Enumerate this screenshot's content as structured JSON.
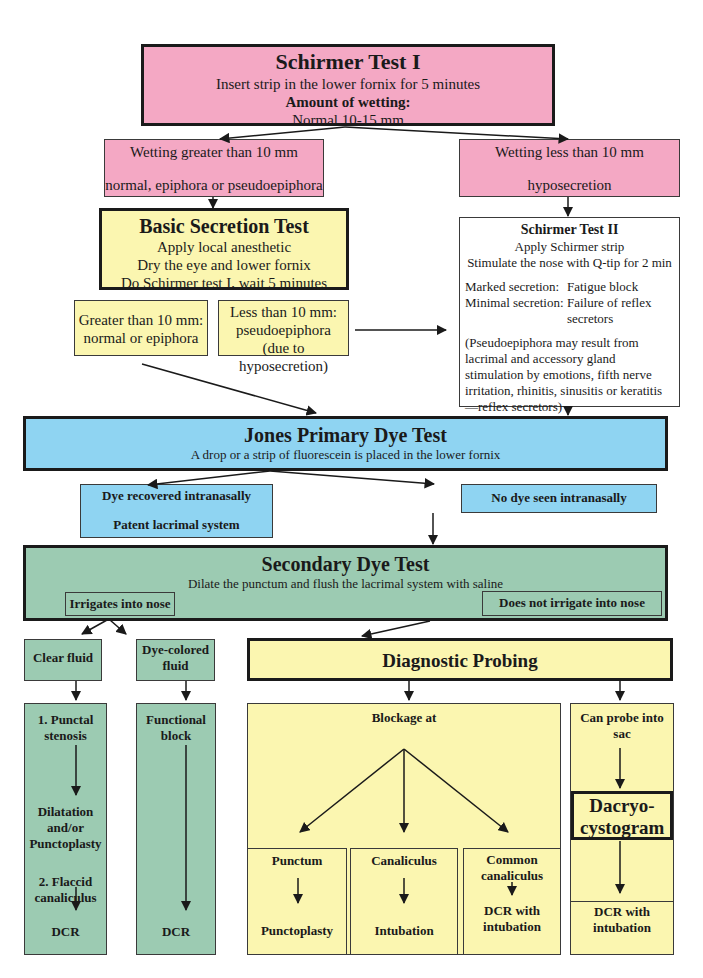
{
  "schirmer1": {
    "title": "Schirmer Test I",
    "line1": "Insert strip in the lower fornix for 5 minutes",
    "line2": "Amount of wetting:",
    "line3": "Normal 10-15 mm"
  },
  "wet_gt": {
    "line1": "Wetting greater than 10 mm",
    "line2": "normal, epiphora or pseudoepiphora"
  },
  "wet_lt": {
    "line1": "Wetting less than 10 mm",
    "line2": "hyposecretion"
  },
  "basic": {
    "title": "Basic Secretion Test",
    "lines": [
      "Apply local anesthetic",
      "Dry the eye and lower fornix",
      "Do Schirmer test I, wait 5 minutes"
    ]
  },
  "basic_gt": {
    "line1": "Greater than 10 mm:",
    "line2": "normal or epiphora"
  },
  "basic_lt": {
    "line1": "Less than 10 mm:",
    "line2": "pseudoepiphora",
    "line3": "(due to hyposecretion)"
  },
  "schirmer2": {
    "title": "Schirmer Test II",
    "line1": "Apply Schirmer strip",
    "line2": "Stimulate the nose with Q-tip for 2 min",
    "marked_label": "Marked secretion:",
    "marked_value": "Fatigue block",
    "minimal_label": "Minimal secretion:",
    "minimal_value": "Failure of reflex secretors",
    "note": "(Pseudoepiphora may result from lacrimal and accessory gland stimulation by emotions, fifth nerve irritation, rhinitis, sinusitis or keratitis—reflex secretors)"
  },
  "jones": {
    "title": "Jones Primary Dye Test",
    "subtitle": "A drop or a strip of fluorescein is placed in the lower fornix"
  },
  "dye_recovered": {
    "line1": "Dye recovered intranasally",
    "line2": "Patent lacrimal system"
  },
  "no_dye": {
    "label": "No dye seen intranasally"
  },
  "secondary": {
    "title": "Secondary Dye Test",
    "subtitle": "Dilate the punctum and flush the lacrimal system with saline",
    "irrigates": "Irrigates into nose",
    "not_irrigates": "Does not irrigate into nose"
  },
  "clear_fluid": {
    "label": "Clear fluid"
  },
  "dye_fluid": {
    "label": "Dye-colored fluid"
  },
  "probing": {
    "title": "Diagnostic Probing"
  },
  "clear_col": {
    "item1": "1. Punctal stenosis",
    "item1_result": "Dilatation and/or Punctoplasty",
    "item2": "2. Flaccid canaliculus",
    "item2_result": "DCR"
  },
  "dye_col": {
    "label": "Functional block",
    "result": "DCR"
  },
  "blockage": {
    "title": "Blockage at",
    "sites": [
      {
        "name": "Punctum",
        "result": "Punctoplasty"
      },
      {
        "name": "Canaliculus",
        "result": "Intubation"
      },
      {
        "name": "Common canaliculus",
        "result": "DCR with intubation"
      }
    ]
  },
  "sac": {
    "label": "Can probe into sac",
    "dacryo": "Dacryo-cystogram",
    "result": "DCR with intubation"
  },
  "colors": {
    "pink": "#f4a8c4",
    "yellow": "#fbf6b0",
    "blue": "#8fd4f2",
    "green": "#9ccbb2",
    "border": "#1a1a1a"
  }
}
